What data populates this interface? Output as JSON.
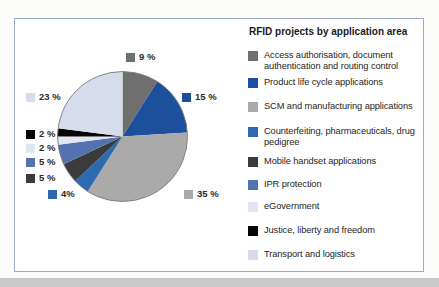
{
  "figure": {
    "title": "RFID projects by application area"
  },
  "chart_data": {
    "type": "pie",
    "title": "RFID projects by application area",
    "direction": "clockwise",
    "start_angle_deg": -90,
    "total": 100,
    "legend_position": "right",
    "series": [
      {
        "label": "Access authorisation, document authentication and routing control",
        "value": 9,
        "pct_label": "9 %",
        "color": "#6f6f6f"
      },
      {
        "label": "Product life cycle applications",
        "value": 15,
        "pct_label": "15 %",
        "color": "#1c4f9c"
      },
      {
        "label": "SCM and manufacturing applications",
        "value": 35,
        "pct_label": "35 %",
        "color": "#aaaaaa"
      },
      {
        "label": "Counterfeiting, pharmaceuticals, drug pedigree",
        "value": 4,
        "pct_label": "4%",
        "color": "#2d6ab0"
      },
      {
        "label": "Mobile handset applications",
        "value": 5,
        "pct_label": "5 %",
        "color": "#3b3b3b"
      },
      {
        "label": "IPR protection",
        "value": 5,
        "pct_label": "5 %",
        "color": "#5472b0"
      },
      {
        "label": "eGovernment",
        "value": 2,
        "pct_label": "2 %",
        "color": "#e2e5f2"
      },
      {
        "label": "Justice, liberty and freedom",
        "value": 2,
        "pct_label": "2 %",
        "color": "#060606"
      },
      {
        "label": "Transport and logistics",
        "value": 23,
        "pct_label": "23 %",
        "color": "#d6dcea"
      }
    ]
  },
  "colors": {
    "panel_border": "#9eaac9",
    "panel_bg": "#fefefe",
    "page_bg": "#fcfcfb",
    "bottom_strip": "#c8c9ca",
    "pie_outline": "#7b7b7b",
    "text": "#262626"
  },
  "geometry_note": "pie center (122.5,136.5) radius 65"
}
